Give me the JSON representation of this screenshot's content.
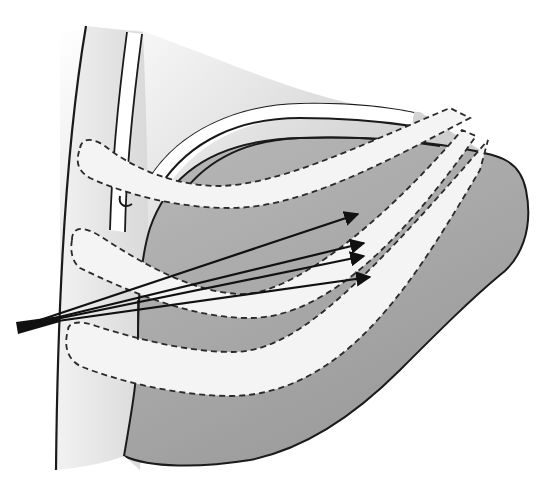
{
  "figure": {
    "type": "anatomical-schematic",
    "style": "grayscale line drawing, no text labels",
    "colors": {
      "background": "#ffffff",
      "outer_band": "#e6e6e6",
      "inner_mass": "#a9a9a9",
      "light_channel": "#f4f4f4",
      "outline": "#1a1a1a",
      "dash": "#2a2a2a"
    },
    "elements": {
      "vertical_band": "curved light-gray band on left edge",
      "inner_mass": "darker gray rounded mass occupying right/bottom",
      "curved_vessel": "double-walled white tube arching from left to upper right",
      "dashed_channels": 3,
      "arrows": 4,
      "arrow_origin": "tapered wedge at left (approx. x=17, y=328)"
    },
    "arrows": [
      {
        "from": [
          22,
          326
        ],
        "to": [
          360,
          214
        ]
      },
      {
        "from": [
          22,
          326
        ],
        "to": [
          366,
          243
        ]
      },
      {
        "from": [
          22,
          326
        ],
        "to": [
          366,
          256
        ]
      },
      {
        "from": [
          22,
          326
        ],
        "to": [
          372,
          277
        ]
      }
    ]
  }
}
